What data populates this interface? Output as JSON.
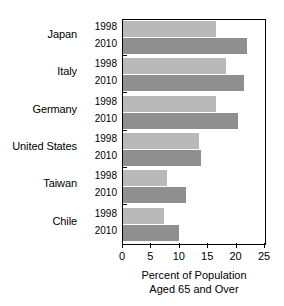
{
  "chart_data": {
    "type": "bar",
    "orientation": "horizontal",
    "title": "",
    "xlabel": "Percent of Population Aged 65 and Over",
    "xlabel_line1": "Percent of Population",
    "xlabel_line2": "Aged 65 and Over",
    "ylabel": "",
    "xlim": [
      0,
      25
    ],
    "xticks": [
      0,
      5,
      10,
      15,
      20,
      25
    ],
    "xtick_labels": [
      "0",
      "5",
      "10",
      "15",
      "20",
      "25"
    ],
    "grid": false,
    "legend": "none",
    "categories": [
      "Japan",
      "Italy",
      "Germany",
      "United States",
      "Taiwan",
      "Chile"
    ],
    "series": [
      {
        "name": "1998",
        "color": "#b9b9b9",
        "values": [
          16.4,
          18.1,
          16.4,
          13.4,
          7.7,
          7.2
        ]
      },
      {
        "name": "2010",
        "color": "#8f8f8f",
        "values": [
          21.8,
          21.3,
          20.2,
          13.7,
          11.1,
          9.9
        ]
      }
    ],
    "rows": [
      {
        "country": "Japan",
        "year_1998": "1998",
        "year_2010": "2010",
        "v1998": 16.4,
        "v2010": 21.8
      },
      {
        "country": "Italy",
        "year_1998": "1998",
        "year_2010": "2010",
        "v1998": 18.1,
        "v2010": 21.3
      },
      {
        "country": "Germany",
        "year_1998": "1998",
        "year_2010": "2010",
        "v1998": 16.4,
        "v2010": 20.2
      },
      {
        "country": "United States",
        "year_1998": "1998",
        "year_2010": "2010",
        "v1998": 13.4,
        "v2010": 13.7
      },
      {
        "country": "Taiwan",
        "year_1998": "1998",
        "year_2010": "2010",
        "v1998": 7.7,
        "v2010": 11.1
      },
      {
        "country": "Chile",
        "year_1998": "1998",
        "year_2010": "2010",
        "v1998": 7.2,
        "v2010": 9.9
      }
    ]
  },
  "colors": {
    "bar_1998": "#b9b9b9",
    "bar_2010": "#8f8f8f",
    "axis": "#000000",
    "background": "#ffffff"
  }
}
